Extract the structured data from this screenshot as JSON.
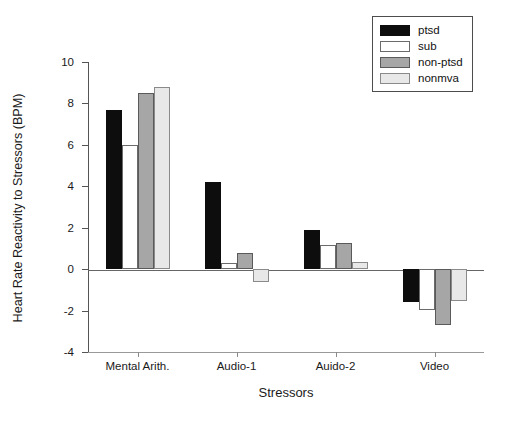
{
  "chart_data": {
    "type": "bar",
    "title": "",
    "xlabel": "Stressors",
    "ylabel": "Heart Rate Reactivity to Stressors (BPM)",
    "categories": [
      "Mental Arith.",
      "Audio-1",
      "Auido-2",
      "Video"
    ],
    "series": [
      {
        "name": "ptsd",
        "color": "#0d0d0d",
        "values": [
          7.7,
          4.2,
          1.9,
          -1.6
        ]
      },
      {
        "name": "sub",
        "color": "#ffffff",
        "values": [
          6.0,
          0.3,
          1.15,
          -1.95
        ]
      },
      {
        "name": "non-ptsd",
        "color": "#a6a6a6",
        "values": [
          8.5,
          0.8,
          1.25,
          -2.7
        ]
      },
      {
        "name": "nonmva",
        "color": "#e8e8e8",
        "values": [
          8.8,
          -0.6,
          0.35,
          -1.55
        ]
      }
    ],
    "ylim": [
      -4,
      10
    ],
    "yticks": [
      10,
      8,
      6,
      4,
      2,
      0,
      -2,
      -4
    ],
    "ytick_labels": [
      "10",
      "8",
      "6",
      "4",
      "2",
      "0",
      "-2",
      "-4"
    ],
    "grid": false,
    "legend_position": "top-right",
    "legend_entries": [
      "ptsd",
      "sub",
      "non-ptsd",
      "nonmva"
    ]
  },
  "axes": {
    "y_title": "Heart Rate Reactivity to Stressors (BPM)",
    "x_title": "Stressors"
  },
  "legend": {
    "items": [
      {
        "label": "ptsd"
      },
      {
        "label": "sub"
      },
      {
        "label": "non-ptsd"
      },
      {
        "label": "nonmva"
      }
    ]
  }
}
